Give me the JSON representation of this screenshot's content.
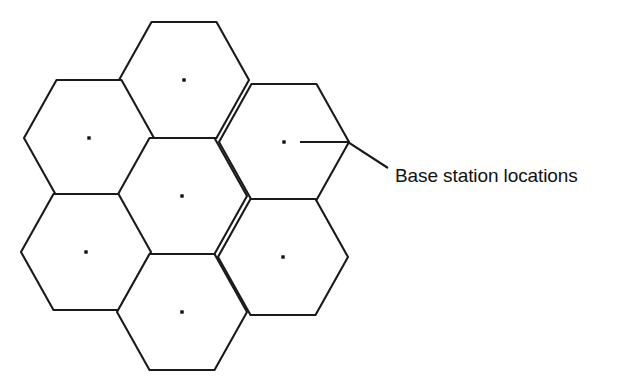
{
  "figure": {
    "background_color": "#ffffff",
    "line_color": "#1a1a1a",
    "dot_color": "#111111",
    "width": 632,
    "height": 386
  },
  "annotation": {
    "label": "Base station locations",
    "leader_points": "300,142 348,142 388,168"
  },
  "chart_data": {
    "type": "diagram",
    "subtype": "hexagonal-cell-layout",
    "title": "Base station locations",
    "xlabel": "",
    "ylabel": "",
    "grid": false,
    "legend": null,
    "cluster_size": 7,
    "hex_orientation": "flat-top",
    "hex_radius_px": 65,
    "hex_height_px": 116,
    "cells": [
      {
        "id": "cell-top",
        "label": "",
        "cx": 184,
        "cy": 80,
        "has_base_station": true
      },
      {
        "id": "cell-upper-left",
        "label": "",
        "cx": 89,
        "cy": 138,
        "has_base_station": true
      },
      {
        "id": "cell-upper-right",
        "label": "",
        "cx": 284,
        "cy": 142,
        "has_base_station": true
      },
      {
        "id": "cell-center",
        "label": "",
        "cx": 182,
        "cy": 196,
        "has_base_station": true
      },
      {
        "id": "cell-lower-left",
        "label": "",
        "cx": 86,
        "cy": 252,
        "has_base_station": true
      },
      {
        "id": "cell-lower-right",
        "label": "",
        "cx": 283,
        "cy": 257,
        "has_base_station": true
      },
      {
        "id": "cell-bottom",
        "label": "",
        "cx": 182,
        "cy": 312,
        "has_base_station": true
      }
    ],
    "base_stations": [
      {
        "x": 184,
        "y": 80
      },
      {
        "x": 89,
        "y": 138
      },
      {
        "x": 284,
        "y": 142
      },
      {
        "x": 182,
        "y": 196
      },
      {
        "x": 86,
        "y": 252
      },
      {
        "x": 283,
        "y": 257
      },
      {
        "x": 182,
        "y": 312
      }
    ],
    "annotations": [
      {
        "text": "Base station locations",
        "x": 395,
        "y": 178,
        "points_to": {
          "x": 300,
          "y": 142
        }
      }
    ]
  }
}
